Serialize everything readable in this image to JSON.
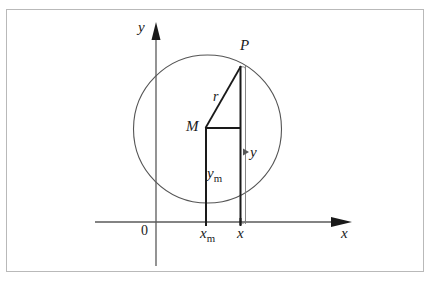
{
  "figure": {
    "kind": "geometry-diagram",
    "background_color": "#ffffff",
    "frame_color": "#b9b9b9",
    "stroke_color": "#1a1a1a",
    "circle_color": "#555555"
  },
  "axes": {
    "x_label": "x",
    "y_label": "y",
    "origin_label": "0",
    "x_axis_y": 222,
    "y_axis_x": 156,
    "x_axis_start": 95,
    "x_axis_end": 352,
    "y_axis_top": 24,
    "y_axis_bottom": 266
  },
  "labels": {
    "point_p": "P",
    "point_m": "M",
    "radius": "r",
    "height_y": "y",
    "height_ym_main": "y",
    "height_ym_sub": "m",
    "abscissa_xm_main": "x",
    "abscissa_xm_sub": "m",
    "abscissa_x": "x"
  },
  "geometry": {
    "circle": {
      "cx": 207.5,
      "cy": 129,
      "r": 74
    },
    "point_m": {
      "x": 206,
      "y": 128
    },
    "point_p": {
      "x": 241,
      "y": 66
    },
    "drop_line_m": {
      "x": 206,
      "y1": 128,
      "y2": 224
    },
    "drop_line_p": {
      "x": 240.5,
      "y1": 66,
      "y2": 224
    },
    "horizontal_mp_base": {
      "x1": 206,
      "x2": 240.5,
      "y": 128
    },
    "radius_segment": {
      "x1": 206,
      "y1": 128,
      "x2": 241,
      "y2": 66
    },
    "y_measure_line": {
      "x": 245.5,
      "y1": 66,
      "y2": 224
    },
    "y_measure_arrow": {
      "x": 243,
      "y": 152
    },
    "tick_xm": {
      "x": 206,
      "y1": 218,
      "y2": 226
    },
    "tick_x": {
      "x": 240.5,
      "y1": 218,
      "y2": 226
    }
  },
  "tick_labels": [
    {
      "name": "tick-label-xm",
      "main": "x",
      "sub": "m",
      "x": 200,
      "y": 226
    },
    {
      "name": "tick-label-x",
      "main": "x",
      "sub": "",
      "x": 236,
      "y": 226
    }
  ]
}
